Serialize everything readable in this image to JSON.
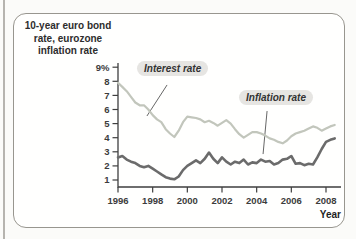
{
  "figure": {
    "title_lines": [
      "10-year euro bond",
      "rate, eurozone",
      "inflation rate"
    ]
  },
  "chart_data": {
    "type": "line",
    "title": "10-year euro bond rate, eurozone inflation rate",
    "xlabel": "Year",
    "ylabel": "",
    "xlim": [
      1996,
      2008.9
    ],
    "ylim": [
      0.5,
      9.5
    ],
    "grid": false,
    "legend_position": "inline-annotations",
    "colors": {
      "axis": "#3f3f3f",
      "text": "#3c3c3c",
      "xlabel_text": "#1f1f1f",
      "interest_line": "#c2c6bc",
      "inflation_line": "#6b6b6b",
      "label_bg": "#e6e5e2",
      "box_border": "#98968f",
      "callout": "#555555"
    },
    "x_ticks": [
      1996,
      1998,
      2000,
      2002,
      2004,
      2006,
      2008
    ],
    "y_ticks": [
      {
        "value": 9,
        "label": "9%"
      },
      {
        "value": 8,
        "label": "8"
      },
      {
        "value": 7,
        "label": "7"
      },
      {
        "value": 6,
        "label": "6"
      },
      {
        "value": 5,
        "label": "5"
      },
      {
        "value": 4,
        "label": "4"
      },
      {
        "value": 3,
        "label": "3"
      },
      {
        "value": 2,
        "label": "2"
      },
      {
        "value": 1,
        "label": "1"
      }
    ],
    "x": [
      1996,
      1996.25,
      1996.5,
      1996.75,
      1997,
      1997.25,
      1997.5,
      1997.75,
      1998,
      1998.25,
      1998.5,
      1998.75,
      1999,
      1999.25,
      1999.5,
      1999.75,
      2000,
      2000.25,
      2000.5,
      2000.75,
      2001,
      2001.25,
      2001.5,
      2001.75,
      2002,
      2002.25,
      2002.5,
      2002.75,
      2003,
      2003.25,
      2003.5,
      2003.75,
      2004,
      2004.25,
      2004.5,
      2004.75,
      2005,
      2005.25,
      2005.5,
      2005.75,
      2006,
      2006.25,
      2006.5,
      2006.75,
      2007,
      2007.25,
      2007.5,
      2007.75,
      2008,
      2008.25,
      2008.5
    ],
    "series": [
      {
        "name": "Interest rate",
        "data_name": "interest-rate",
        "color": "#c2c6bc",
        "width": 2.2,
        "values": [
          7.9,
          7.6,
          7.3,
          6.9,
          6.5,
          6.3,
          6.3,
          6.0,
          5.6,
          5.3,
          5.1,
          4.6,
          4.3,
          4.05,
          4.5,
          5.1,
          5.5,
          5.45,
          5.4,
          5.3,
          5.1,
          5.2,
          5.05,
          4.85,
          5.05,
          5.25,
          5.0,
          4.6,
          4.25,
          4.0,
          4.2,
          4.4,
          4.4,
          4.3,
          4.15,
          3.95,
          3.85,
          3.7,
          3.6,
          3.8,
          4.1,
          4.3,
          4.4,
          4.5,
          4.65,
          4.8,
          4.7,
          4.5,
          4.65,
          4.8,
          4.9
        ]
      },
      {
        "name": "Inflation rate",
        "data_name": "inflation-rate",
        "color": "#6b6b6b",
        "width": 2.6,
        "values": [
          2.6,
          2.7,
          2.45,
          2.3,
          2.2,
          2.0,
          1.9,
          2.0,
          1.8,
          1.6,
          1.4,
          1.2,
          1.1,
          1.05,
          1.25,
          1.7,
          2.0,
          2.2,
          2.4,
          2.2,
          2.5,
          2.95,
          2.5,
          2.2,
          2.6,
          2.3,
          2.1,
          2.3,
          2.2,
          2.45,
          2.1,
          2.25,
          2.2,
          2.45,
          2.3,
          2.35,
          2.1,
          2.2,
          2.45,
          2.5,
          2.7,
          2.15,
          2.2,
          2.05,
          2.15,
          2.1,
          2.6,
          3.2,
          3.7,
          3.85,
          3.95
        ]
      }
    ],
    "annotations": [
      {
        "name": "interest-rate",
        "label": "Interest rate",
        "line_from": {
          "year": 1998.83,
          "value": 7.74
        },
        "line_to": {
          "year": 1997.67,
          "value": 5.54
        }
      },
      {
        "name": "inflation-rate",
        "label": "Inflation rate",
        "line_from": {
          "year": 2004.6,
          "value": 5.89
        },
        "line_to": {
          "year": 2004.37,
          "value": 2.84
        }
      }
    ]
  }
}
